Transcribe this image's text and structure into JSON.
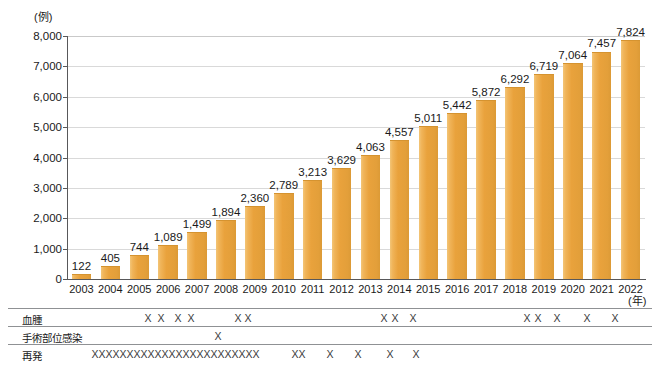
{
  "chart_data": {
    "type": "bar",
    "title": "",
    "subtitle": "",
    "xlabel": "(年)",
    "ylabel": "(例)",
    "ylim": [
      0,
      8000
    ],
    "yticks": [
      "0",
      "1,000",
      "2,000",
      "3,000",
      "4,000",
      "5,000",
      "6,000",
      "7,000",
      "8,000"
    ],
    "ytick_values": [
      0,
      1000,
      2000,
      3000,
      4000,
      5000,
      6000,
      7000,
      8000
    ],
    "grid": true,
    "legend": "none",
    "bar_color": "#e9a23c",
    "categories": [
      "2003",
      "2004",
      "2005",
      "2006",
      "2007",
      "2008",
      "2009",
      "2010",
      "2011",
      "2012",
      "2013",
      "2014",
      "2015",
      "2016",
      "2017",
      "2018",
      "2019",
      "2020",
      "2021",
      "2022"
    ],
    "values": [
      122,
      405,
      744,
      1089,
      1499,
      1894,
      2360,
      2789,
      3213,
      3629,
      4063,
      4557,
      5011,
      5442,
      5872,
      6292,
      6719,
      7064,
      7457,
      7824
    ],
    "value_labels": [
      "122",
      "405",
      "744",
      "1,089",
      "1,499",
      "1,894",
      "2,360",
      "2,789",
      "3,213",
      "3,629",
      "4,063",
      "4,557",
      "5,011",
      "5,442",
      "5,872",
      "6,292",
      "6,719",
      "7,064",
      "7,457",
      "7,824"
    ]
  },
  "complication_table": {
    "rows": [
      {
        "label": "血腫",
        "name": "hematoma",
        "marks": [
          148,
          161,
          178,
          191,
          238,
          248,
          384,
          395,
          413,
          527,
          538,
          557,
          587,
          615
        ]
      },
      {
        "label": "手術部位感染",
        "name": "surgical-site-infection",
        "marks": [
          218
        ]
      },
      {
        "label": "再発",
        "name": "recurrence",
        "marks": [
          95,
          102,
          109,
          116,
          123,
          130,
          137,
          144,
          151,
          158,
          165,
          172,
          179,
          186,
          193,
          200,
          207,
          214,
          221,
          228,
          235,
          242,
          249,
          256,
          295,
          302,
          330,
          358,
          390,
          416
        ]
      }
    ],
    "mark_glyph": "X"
  }
}
